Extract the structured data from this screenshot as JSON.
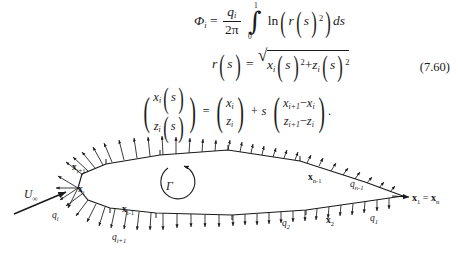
{
  "equation": {
    "number": "(7.60)",
    "line1": {
      "lhs_symbol": "Φ",
      "lhs_sub": "i",
      "equals": "=",
      "frac_num_symbol": "q",
      "frac_num_sub": "i",
      "frac_den": "2π",
      "integral_upper": "1",
      "integral_lower": "0",
      "integrand_fn": "ln",
      "integrand_inner_symbol": "r",
      "integrand_arg": "s",
      "integrand_exponent": "2",
      "differential": "ds"
    },
    "line2": {
      "lhs_symbol": "r",
      "lhs_arg": "s",
      "equals": "=",
      "term1_symbol": "x",
      "term1_sub": "i",
      "term1_arg": "s",
      "term1_exp": "2",
      "plus": "+",
      "term2_symbol": "z",
      "term2_sub": "i",
      "term2_arg": "s",
      "term2_exp": "2"
    },
    "line3": {
      "lhs_row1_symbol": "x",
      "lhs_row1_sub": "i",
      "lhs_row1_arg": "s",
      "lhs_row2_symbol": "z",
      "lhs_row2_sub": "i",
      "lhs_row2_arg": "s",
      "equals": "=",
      "mid_row1_symbol": "x",
      "mid_row1_sub": "i",
      "mid_row2_symbol": "z",
      "mid_row2_sub": "i",
      "plus_s": "+ s",
      "rhs_row1": "xᵢ₊₁ − xᵢ",
      "rhs_row1_a_symbol": "x",
      "rhs_row1_a_sub": "i+1",
      "rhs_row1_minus": "−",
      "rhs_row1_b_symbol": "x",
      "rhs_row1_b_sub": "i",
      "rhs_row2_a_symbol": "z",
      "rhs_row2_a_sub": "i+1",
      "rhs_row2_minus": "−",
      "rhs_row2_b_symbol": "z",
      "rhs_row2_b_sub": "i",
      "period": "."
    }
  },
  "figure": {
    "freestream_symbol": "U",
    "freestream_sub": "∞",
    "circulation_symbol": "Γ",
    "labels": [
      {
        "id": "x-i-plus-1",
        "symbol": "x",
        "sub": "i+1",
        "x": 72,
        "y": 42
      },
      {
        "id": "x-i",
        "symbol": "x",
        "sub": "i",
        "x": 78,
        "y": 62
      },
      {
        "id": "x-i-minus-1",
        "symbol": "x",
        "sub": "i-1",
        "x": 131,
        "y": 83
      },
      {
        "id": "x-2",
        "symbol": "x",
        "sub": "2",
        "x": 330,
        "y": 91
      },
      {
        "id": "x-n-minus-1",
        "symbol": "x",
        "sub": "n-1",
        "x": 312,
        "y": 50
      },
      {
        "id": "q-i",
        "symbol": "q",
        "sub": "i",
        "x": 57,
        "y": 83
      },
      {
        "id": "q-i-plus-1",
        "symbol": "q",
        "sub": "i+1",
        "x": 120,
        "y": 107
      },
      {
        "id": "q-2",
        "symbol": "q",
        "sub": "2",
        "x": 287,
        "y": 94
      },
      {
        "id": "q-1",
        "symbol": "q",
        "sub": "1",
        "x": 372,
        "y": 90
      },
      {
        "id": "q-n-minus-1",
        "symbol": "q",
        "sub": "n-1",
        "x": 354,
        "y": 56
      }
    ],
    "trailing_edge": {
      "left_symbol": "x",
      "left_sub": "1",
      "equals": "=",
      "right_symbol": "x",
      "right_sub": "n",
      "x": 414,
      "y": 73
    }
  },
  "colors": {
    "ink": "#1a1a1a",
    "page": "#ffffff"
  }
}
